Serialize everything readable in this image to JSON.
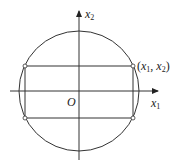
{
  "diagram": {
    "title": "",
    "axes": {
      "horizontal": {
        "label_var": "x",
        "label_sub": "1"
      },
      "vertical": {
        "label_var": "x",
        "label_sub": "2"
      },
      "origin_label": "O"
    },
    "circle": {
      "cx": 79,
      "cy": 91,
      "r": 60
    },
    "rectangle": {
      "x1": 25,
      "y1": 66,
      "x2": 133,
      "y2": 118
    },
    "point_label": {
      "open": "(",
      "var1": "x",
      "sub1": "1",
      "sep": ", ",
      "var2": "x",
      "sub2": "2",
      "close": ")"
    },
    "colors": {
      "stroke": "#333333",
      "background": "#ffffff"
    }
  }
}
